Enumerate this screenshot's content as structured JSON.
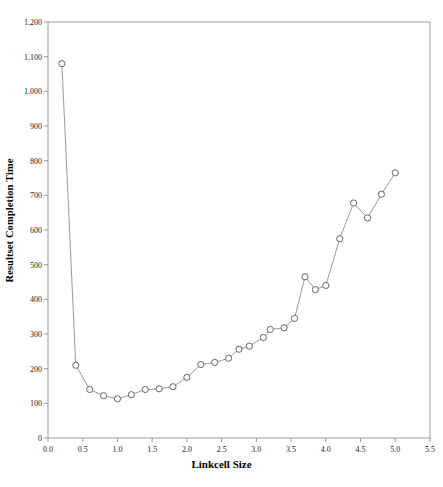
{
  "chart_data": {
    "type": "line",
    "title": "",
    "xlabel": "Linkcell Size",
    "ylabel": "Resultset Completion Time",
    "xlim": [
      0.0,
      5.5
    ],
    "ylim": [
      0,
      1200
    ],
    "xticks": [
      "0.0",
      "0.5",
      "1.0",
      "1.5",
      "2.0",
      "2.5",
      "3.0",
      "3.5",
      "4.0",
      "4.5",
      "5.0",
      "5.5"
    ],
    "yticks": [
      "0",
      "100",
      "200",
      "300",
      "400",
      "500",
      "600",
      "700",
      "800",
      "900",
      "1,000",
      "1,100",
      "1,200"
    ],
    "grid": false,
    "legend": null,
    "marker": "open-circle",
    "line_color": "#8c8c8c",
    "marker_color": "#555555",
    "axis_color": "#9a9a9a",
    "series": [
      {
        "name": "Resultset Completion Time",
        "x": [
          0.2,
          0.4,
          0.6,
          0.8,
          1.0,
          1.2,
          1.4,
          1.6,
          1.8,
          2.0,
          2.2,
          2.35,
          2.5,
          2.65,
          2.8,
          3.0,
          3.15,
          3.35,
          3.55,
          3.75,
          3.95,
          4.15,
          4.35,
          4.55,
          4.75,
          5.0
        ],
        "y": [
          1080,
          210,
          140,
          122,
          117,
          124,
          140,
          143,
          148,
          175,
          212,
          220,
          230,
          255,
          265,
          290,
          313,
          318,
          345,
          465,
          428,
          440,
          575,
          678,
          635,
          703
        ]
      }
    ],
    "points": [
      {
        "x": 0.2,
        "y": 1080
      },
      {
        "x": 0.4,
        "y": 210
      },
      {
        "x": 0.6,
        "y": 140
      },
      {
        "x": 0.8,
        "y": 122
      },
      {
        "x": 1.0,
        "y": 113
      },
      {
        "x": 1.2,
        "y": 125
      },
      {
        "x": 1.4,
        "y": 140
      },
      {
        "x": 1.6,
        "y": 142
      },
      {
        "x": 1.8,
        "y": 148
      },
      {
        "x": 2.0,
        "y": 175
      },
      {
        "x": 2.2,
        "y": 212
      },
      {
        "x": 2.4,
        "y": 218
      },
      {
        "x": 2.6,
        "y": 230
      },
      {
        "x": 2.75,
        "y": 256
      },
      {
        "x": 2.9,
        "y": 265
      },
      {
        "x": 3.1,
        "y": 290
      },
      {
        "x": 3.2,
        "y": 313
      },
      {
        "x": 3.4,
        "y": 318
      },
      {
        "x": 3.55,
        "y": 345
      },
      {
        "x": 3.7,
        "y": 465
      },
      {
        "x": 3.85,
        "y": 428
      },
      {
        "x": 4.0,
        "y": 440
      },
      {
        "x": 4.2,
        "y": 575
      },
      {
        "x": 4.4,
        "y": 678
      },
      {
        "x": 4.6,
        "y": 635
      },
      {
        "x": 4.8,
        "y": 703
      },
      {
        "x": 5.0,
        "y": 765
      }
    ]
  }
}
